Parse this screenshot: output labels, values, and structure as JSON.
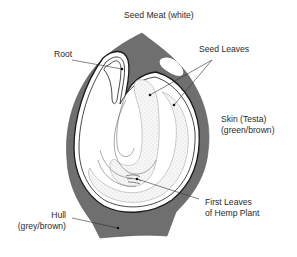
{
  "diagram": {
    "colors": {
      "hull": "#6f6f6f",
      "outline": "#1a1a1a",
      "stipple": "#d9d9d9",
      "background": "#ffffff",
      "text": "#2a2a2a"
    },
    "labels": {
      "seed_meat": "Seed Meat (white)",
      "root": "Root",
      "seed_leaves": "Seed Leaves",
      "skin_line1": "Skin (Testa)",
      "skin_line2": "(green/brown)",
      "first_leaves_line1": "First Leaves",
      "first_leaves_line2": "of Hemp Plant",
      "hull_line1": "Hull",
      "hull_line2": "(grey/brown)"
    }
  }
}
